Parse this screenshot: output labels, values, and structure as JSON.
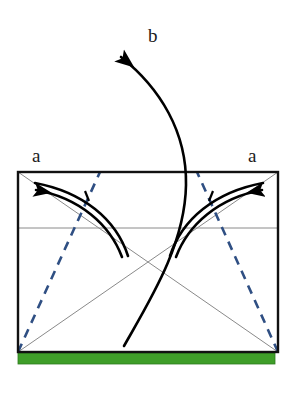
{
  "figure": {
    "title": "",
    "type": "physics-force-diagram",
    "canvas": {
      "width": 295,
      "height": 397
    }
  },
  "labels": {
    "a_left": "a",
    "a_right": "a",
    "b": "b"
  },
  "colors": {
    "background": "#ffffff",
    "outline": "#111111",
    "thin_line": "#8a8a8a",
    "dashed_blue": "#2f4f83",
    "ground_green": "#3f9e29",
    "ground_green_edge": "#2f7a1f",
    "arrow_black": "#000000",
    "text": "#1a1a1a"
  },
  "shapes": {
    "rectangle": {
      "name": "main-rectangle",
      "x": 18,
      "y": 172,
      "width": 260,
      "height": 180,
      "stroke": "#111111",
      "stroke_width": 2.4,
      "fill": "none"
    },
    "ground_bar": {
      "name": "green-ground-bar",
      "x": 18,
      "y": 353,
      "width": 257,
      "height": 11,
      "fill": "#3f9e29"
    },
    "midline": {
      "name": "horizontal-midline",
      "x1": 18,
      "y1": 228,
      "x2": 278,
      "y2": 228,
      "stroke": "#8a8a8a",
      "stroke_width": 1
    },
    "diagonal_1": {
      "name": "diagonal-tl-br",
      "x1": 18,
      "y1": 352,
      "x2": 278,
      "y2": 172,
      "stroke": "#8a8a8a",
      "stroke_width": 1
    },
    "diagonal_2": {
      "name": "diagonal-tr-bl",
      "x1": 278,
      "y1": 352,
      "x2": 18,
      "y2": 172,
      "stroke": "#8a8a8a",
      "stroke_width": 1
    },
    "dashed_left": {
      "name": "dashed-line-left",
      "x1": 18,
      "y1": 352,
      "x2": 100,
      "y2": 172,
      "stroke": "#2f4f83",
      "stroke_width": 2.6,
      "dash": "9 7"
    },
    "dashed_right": {
      "name": "dashed-line-right",
      "x1": 278,
      "y1": 352,
      "x2": 197,
      "y2": 172,
      "stroke": "#2f4f83",
      "stroke_width": 2.6,
      "dash": "9 7"
    }
  },
  "arrows": {
    "left_pair": {
      "name": "curved-arrow-left",
      "direction": "up-left",
      "tip": {
        "x": 36,
        "y": 188
      },
      "tail": {
        "x": 122,
        "y": 257
      },
      "count": 2
    },
    "right_pair": {
      "name": "curved-arrow-right",
      "direction": "up-right",
      "tip": {
        "x": 262,
        "y": 188
      },
      "tail": {
        "x": 176,
        "y": 257
      },
      "count": 2
    },
    "b_arrow": {
      "name": "curved-arrow-b",
      "direction": "up-left",
      "tip": {
        "x": 121,
        "y": 57
      },
      "tail": {
        "x": 124,
        "y": 346
      },
      "count": 1
    }
  }
}
